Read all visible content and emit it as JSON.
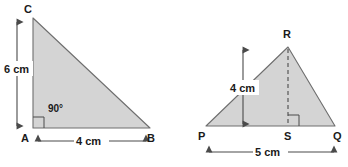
{
  "figure": {
    "colors": {
      "shape_fill": "#d4d4d4",
      "shape_stroke": "#6e6e6e",
      "dimension_line": "#4a4a4a",
      "text": "#1a1a1a",
      "background": "#ffffff"
    },
    "shapes": [
      {
        "id": "triangle-abc",
        "name": "right-triangle-ABC",
        "kind": "right triangle",
        "vertices": [
          {
            "name": "C",
            "label": "C",
            "x": 33,
            "y": 18
          },
          {
            "name": "A",
            "label": "A",
            "x": 33,
            "y": 128
          },
          {
            "name": "B",
            "label": "B",
            "x": 150,
            "y": 128
          }
        ],
        "angle_marks": [
          {
            "at": "A",
            "label": "90°",
            "type": "square"
          }
        ],
        "dimensions": [
          {
            "name": "height",
            "label": "6 cm",
            "value": 6,
            "unit": "cm",
            "orientation": "vertical",
            "between": [
              "A",
              "C"
            ]
          },
          {
            "name": "base",
            "label": "4 cm",
            "value": 4,
            "unit": "cm",
            "orientation": "horizontal",
            "between": [
              "A",
              "B"
            ]
          }
        ]
      },
      {
        "id": "triangle-pqr",
        "name": "triangle-PQR",
        "kind": "triangle with altitude",
        "vertices": [
          {
            "name": "R",
            "label": "R",
            "x": 288,
            "y": 47
          },
          {
            "name": "P",
            "label": "P",
            "x": 206,
            "y": 126
          },
          {
            "name": "Q",
            "label": "Q",
            "x": 335,
            "y": 126
          },
          {
            "name": "S",
            "label": "S",
            "x": 288,
            "y": 126
          }
        ],
        "altitude": {
          "from": "R",
          "to": "S",
          "style": "dashed"
        },
        "angle_marks": [
          {
            "at": "S",
            "label": "",
            "type": "square"
          }
        ],
        "dimensions": [
          {
            "name": "height",
            "label": "4 cm",
            "value": 4,
            "unit": "cm",
            "orientation": "vertical",
            "between": [
              "S",
              "R"
            ]
          },
          {
            "name": "base",
            "label": "5 cm",
            "value": 5,
            "unit": "cm",
            "orientation": "horizontal",
            "between": [
              "P",
              "Q"
            ]
          }
        ]
      }
    ],
    "labels": {
      "C": "C",
      "A": "A",
      "B": "B",
      "R": "R",
      "P": "P",
      "S": "S",
      "Q": "Q",
      "angle_90": "90°",
      "height_abc": "6 cm",
      "base_abc": "4 cm",
      "height_pqr": "4 cm",
      "base_pqr": "5 cm"
    }
  }
}
